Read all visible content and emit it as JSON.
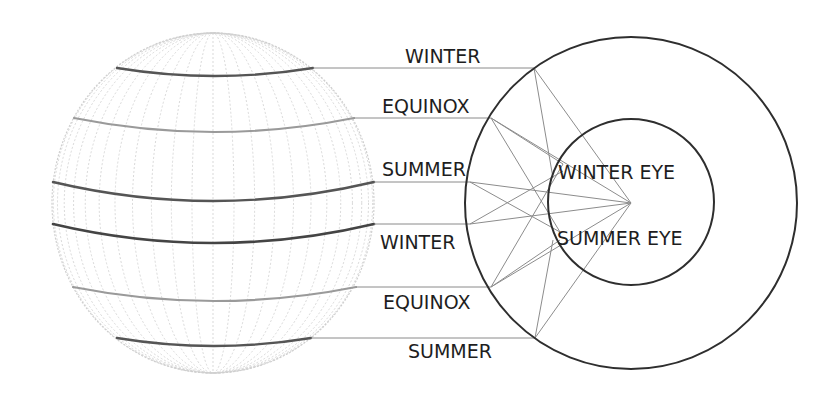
{
  "diagram": {
    "globe": {
      "cx": 213,
      "cy": 203,
      "rx": 161,
      "ry": 170,
      "grid_color": "#cfcfcf",
      "meridian_count": 24,
      "bands": [
        {
          "name": "winter-top",
          "y_end": 68,
          "sag": 8,
          "x0": 117,
          "x1": 313,
          "color": "#555555",
          "width": 2.4
        },
        {
          "name": "equinox-top",
          "y_end": 118,
          "sag": 14,
          "x0": 74,
          "x1": 354,
          "color": "#9a9a9a",
          "width": 2.2
        },
        {
          "name": "summer-top",
          "y_end": 182,
          "sag": 19,
          "x0": 53,
          "x1": 374,
          "color": "#555555",
          "width": 2.4
        },
        {
          "name": "winter-bottom",
          "y_end": 224,
          "sag": 19,
          "x0": 53,
          "x1": 374,
          "color": "#444444",
          "width": 2.6
        },
        {
          "name": "equinox-bottom",
          "y_end": 287,
          "sag": 14,
          "x0": 73,
          "x1": 356,
          "color": "#9a9a9a",
          "width": 2.2
        },
        {
          "name": "summer-bottom",
          "y_end": 338,
          "sag": 8,
          "x0": 117,
          "x1": 311,
          "color": "#555555",
          "width": 2.4
        }
      ]
    },
    "season_labels": [
      {
        "text": "WINTER",
        "x": 405,
        "y": 47,
        "line_y": 68,
        "line_x0": 313,
        "line_x1": 534
      },
      {
        "text": "EQUINOX",
        "x": 382,
        "y": 97,
        "line_y": 118,
        "line_x0": 354,
        "line_x1": 491
      },
      {
        "text": "SUMMER",
        "x": 382,
        "y": 160,
        "line_y": 182,
        "line_x0": 374,
        "line_x1": 470
      },
      {
        "text": "WINTER",
        "x": 380,
        "y": 233,
        "line_y": 224,
        "line_x0": 374,
        "line_x1": 470
      },
      {
        "text": "EQUINOX",
        "x": 383,
        "y": 293,
        "line_y": 287,
        "line_x0": 356,
        "line_x1": 491
      },
      {
        "text": "SUMMER",
        "x": 408,
        "y": 342,
        "line_y": 338,
        "line_x0": 311,
        "line_x1": 535
      }
    ],
    "outer_circle": {
      "cx": 631,
      "cy": 203,
      "r": 166,
      "color": "#2e2e2e",
      "width": 2
    },
    "inner_circle": {
      "cx": 631,
      "cy": 202,
      "r": 83,
      "color": "#2e2e2e",
      "width": 2
    },
    "eye_point": {
      "x": 631,
      "y": 203
    },
    "eye_labels": [
      {
        "text": "WINTER EYE",
        "x": 558,
        "y": 163
      },
      {
        "text": "SUMMER EYE",
        "x": 557,
        "y": 229
      }
    ],
    "ray_color": "#8c8c8c",
    "rays": [
      {
        "x1": 534,
        "y1": 68,
        "x2": 631,
        "y2": 203
      },
      {
        "x1": 534,
        "y1": 68,
        "x2": 553,
        "y2": 178
      },
      {
        "x1": 491,
        "y1": 118,
        "x2": 631,
        "y2": 203
      },
      {
        "x1": 491,
        "y1": 118,
        "x2": 560,
        "y2": 232
      },
      {
        "x1": 491,
        "y1": 118,
        "x2": 563,
        "y2": 164
      },
      {
        "x1": 470,
        "y1": 182,
        "x2": 631,
        "y2": 203
      },
      {
        "x1": 470,
        "y1": 182,
        "x2": 560,
        "y2": 232
      },
      {
        "x1": 470,
        "y1": 224,
        "x2": 631,
        "y2": 203
      },
      {
        "x1": 470,
        "y1": 224,
        "x2": 563,
        "y2": 171
      },
      {
        "x1": 491,
        "y1": 287,
        "x2": 631,
        "y2": 203
      },
      {
        "x1": 491,
        "y1": 287,
        "x2": 563,
        "y2": 164
      },
      {
        "x1": 491,
        "y1": 287,
        "x2": 560,
        "y2": 240
      },
      {
        "x1": 535,
        "y1": 338,
        "x2": 631,
        "y2": 203
      },
      {
        "x1": 535,
        "y1": 338,
        "x2": 553,
        "y2": 240
      }
    ]
  }
}
